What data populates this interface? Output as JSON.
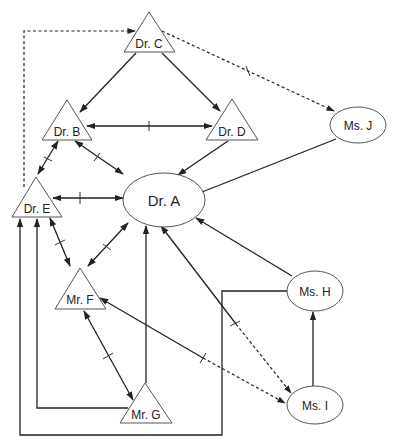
{
  "diagram": {
    "type": "social network / referral diagram",
    "nodes": {
      "dr_a": {
        "label": "Dr. A",
        "shape": "ellipse"
      },
      "dr_b": {
        "label": "Dr. B",
        "shape": "triangle"
      },
      "dr_c": {
        "label": "Dr. C",
        "shape": "triangle"
      },
      "dr_d": {
        "label": "Dr. D",
        "shape": "triangle"
      },
      "dr_e": {
        "label": "Dr. E",
        "shape": "triangle"
      },
      "mr_f": {
        "label": "Mr. F",
        "shape": "triangle"
      },
      "mr_g": {
        "label": "Mr. G",
        "shape": "triangle"
      },
      "ms_h": {
        "label": "Ms. H",
        "shape": "ellipse"
      },
      "ms_i": {
        "label": "Ms. I",
        "shape": "ellipse"
      },
      "ms_j": {
        "label": "Ms. J",
        "shape": "ellipse"
      }
    },
    "edges": [
      {
        "from": "Dr. C",
        "to": "Dr. B",
        "style": "solid",
        "direction": "forward"
      },
      {
        "from": "Dr. C",
        "to": "Dr. D",
        "style": "solid",
        "direction": "forward"
      },
      {
        "from": "Dr. C",
        "to": "Ms. J",
        "style": "dashed",
        "direction": "forward",
        "tick": true
      },
      {
        "from": "Dr. E",
        "to": "Dr. C",
        "style": "dashed",
        "direction": "forward"
      },
      {
        "from": "Dr. B",
        "to": "Dr. D",
        "style": "solid",
        "direction": "both",
        "tick": true
      },
      {
        "from": "Dr. B",
        "to": "Dr. A",
        "style": "solid",
        "direction": "both",
        "tick": true
      },
      {
        "from": "Dr. D",
        "to": "Dr. A",
        "style": "solid",
        "direction": "forward"
      },
      {
        "from": "Ms. J",
        "to": "Dr. A",
        "style": "solid",
        "direction": "forward"
      },
      {
        "from": "Dr. B",
        "to": "Dr. E",
        "style": "solid",
        "direction": "both",
        "tick": true
      },
      {
        "from": "Dr. E",
        "to": "Dr. A",
        "style": "solid",
        "direction": "both",
        "tick": true
      },
      {
        "from": "Dr. E",
        "to": "Mr. F",
        "style": "solid",
        "direction": "both",
        "tick": true
      },
      {
        "from": "Dr. A",
        "to": "Mr. F",
        "style": "solid",
        "direction": "both",
        "tick": true
      },
      {
        "from": "Mr. G",
        "to": "Dr. A",
        "style": "solid",
        "direction": "forward"
      },
      {
        "from": "Ms. H",
        "to": "Dr. A",
        "style": "solid",
        "direction": "forward"
      },
      {
        "from": "Ms. I",
        "to": "Dr. A",
        "style": "solid/dashed",
        "direction": "both",
        "tick": true
      },
      {
        "from": "Mr. F",
        "to": "Ms. I",
        "style": "solid/dashed",
        "direction": "both",
        "tick": true
      },
      {
        "from": "Mr. F",
        "to": "Mr. G",
        "style": "solid",
        "direction": "both",
        "tick": true
      },
      {
        "from": "Mr. G",
        "to": "Dr. E",
        "style": "solid elbow",
        "direction": "forward"
      },
      {
        "from": "Ms. H",
        "to": "Dr. E",
        "style": "solid elbow",
        "direction": "forward"
      },
      {
        "from": "Ms. I",
        "to": "Ms. H",
        "style": "solid",
        "direction": "forward"
      }
    ]
  }
}
